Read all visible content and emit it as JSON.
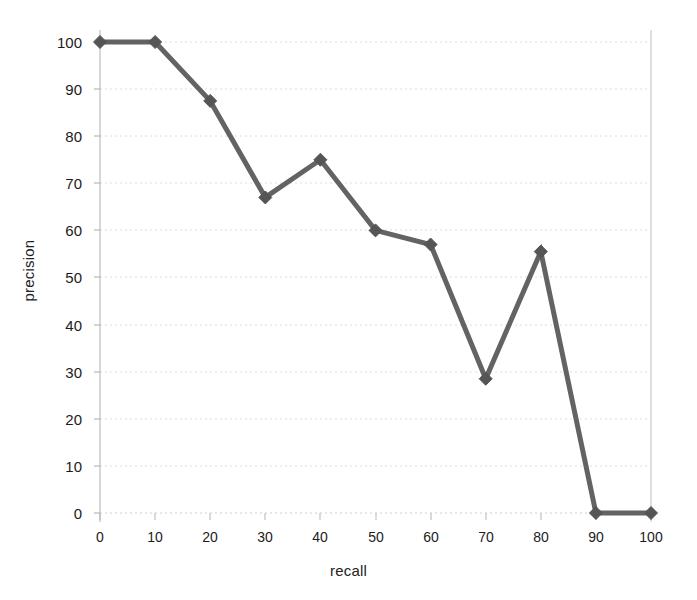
{
  "chart_data": {
    "type": "line",
    "title": "",
    "xlabel": "recall",
    "ylabel": "precision",
    "xlim": [
      0,
      100
    ],
    "ylim": [
      0,
      100
    ],
    "xticks": [
      0,
      10,
      20,
      30,
      40,
      50,
      60,
      70,
      80,
      90,
      100
    ],
    "yticks": [
      0,
      10,
      20,
      30,
      40,
      50,
      60,
      70,
      80,
      90,
      100
    ],
    "grid": true,
    "grid_style": "dotted",
    "legend": false,
    "marker": "diamond",
    "line_color": "#636363",
    "x": [
      0,
      10,
      20,
      30,
      40,
      50,
      60,
      70,
      80,
      90,
      100
    ],
    "values": [
      100,
      100,
      87.5,
      67,
      75,
      60,
      57,
      28.5,
      55.5,
      0,
      0
    ],
    "series": [
      {
        "name": "precision-recall",
        "values": [
          100,
          100,
          87.5,
          67,
          75,
          60,
          57,
          28.5,
          55.5,
          0,
          0
        ]
      }
    ]
  },
  "axes": {
    "y_title": "precision",
    "x_title": "recall",
    "y_tick_labels": [
      "100",
      "90",
      "80",
      "70",
      "60",
      "50",
      "40",
      "30",
      "20",
      "10",
      "0"
    ],
    "x_tick_labels": [
      "0",
      "10",
      "20",
      "30",
      "40",
      "50",
      "60",
      "70",
      "80",
      "90",
      "100"
    ]
  },
  "colors": {
    "line": "#636363",
    "marker": "#555555",
    "grid": "#d9d9d9",
    "axis": "#b0b0b0",
    "text": "#1c1c1c",
    "background": "#ffffff"
  }
}
